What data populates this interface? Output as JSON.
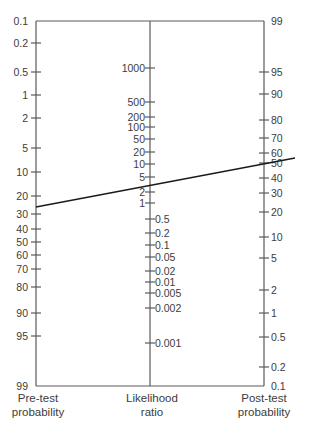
{
  "figure": {
    "axes": {
      "left": {
        "title_line1": "Pre-test",
        "title_line2": "probability",
        "ticks": [
          {
            "label": "0.1",
            "y": 21
          },
          {
            "label": "0.2",
            "y": 43
          },
          {
            "label": "0.5",
            "y": 72
          },
          {
            "label": "1",
            "y": 95
          },
          {
            "label": "2",
            "y": 118
          },
          {
            "label": "5",
            "y": 148
          },
          {
            "label": "10",
            "y": 172
          },
          {
            "label": "20",
            "y": 196
          },
          {
            "label": "30",
            "y": 214
          },
          {
            "label": "40",
            "y": 229
          },
          {
            "label": "50",
            "y": 242
          },
          {
            "label": "60",
            "y": 255
          },
          {
            "label": "70",
            "y": 269
          },
          {
            "label": "80",
            "y": 287
          },
          {
            "label": "90",
            "y": 313
          },
          {
            "label": "95",
            "y": 336
          },
          {
            "label": "99",
            "y": 386
          }
        ]
      },
      "middle": {
        "title_line1": "Likelihood",
        "title_line2": "ratio",
        "ticks_upper": [
          {
            "label": "1000",
            "y": 68
          },
          {
            "label": "500",
            "y": 102
          },
          {
            "label": "200",
            "y": 117
          },
          {
            "label": "100",
            "y": 127
          },
          {
            "label": "50",
            "y": 139
          },
          {
            "label": "20",
            "y": 152
          },
          {
            "label": "10",
            "y": 164
          },
          {
            "label": "5",
            "y": 177
          },
          {
            "label": "2",
            "y": 192
          },
          {
            "label": "1",
            "y": 203
          }
        ],
        "ticks_lower": [
          {
            "label": "0.5",
            "y": 219
          },
          {
            "label": "0.2",
            "y": 233
          },
          {
            "label": "0.1",
            "y": 245
          },
          {
            "label": "0.05",
            "y": 257
          },
          {
            "label": "0.02",
            "y": 271
          },
          {
            "label": "0.01",
            "y": 282
          },
          {
            "label": "0.005",
            "y": 293
          },
          {
            "label": "0.002",
            "y": 308
          },
          {
            "label": "0.001",
            "y": 343
          }
        ]
      },
      "right": {
        "title_line1": "Post-test",
        "title_line2": "probability",
        "ticks": [
          {
            "label": "99",
            "y": 21
          },
          {
            "label": "95",
            "y": 72
          },
          {
            "label": "90",
            "y": 94
          },
          {
            "label": "80",
            "y": 120
          },
          {
            "label": "70",
            "y": 138
          },
          {
            "label": "60",
            "y": 153
          },
          {
            "label": "50",
            "y": 163
          },
          {
            "label": "40",
            "y": 178
          },
          {
            "label": "30",
            "y": 193
          },
          {
            "label": "20",
            "y": 212
          },
          {
            "label": "10",
            "y": 237
          },
          {
            "label": "5",
            "y": 258
          },
          {
            "label": "2",
            "y": 290
          },
          {
            "label": "1",
            "y": 313
          },
          {
            "label": "0.5",
            "y": 337
          },
          {
            "label": "0.2",
            "y": 367
          },
          {
            "label": "0.1",
            "y": 386
          }
        ]
      }
    },
    "example_line": {
      "pre_test_probability_pct": 25,
      "likelihood_ratio": 3,
      "post_test_probability_pct": 50,
      "x1": 36,
      "y1": 207,
      "x2": 295,
      "y2": 158
    },
    "colors": {
      "axis": "#5a5a5a",
      "text": "#3c3c3c",
      "line": "#1a1a1a"
    }
  }
}
